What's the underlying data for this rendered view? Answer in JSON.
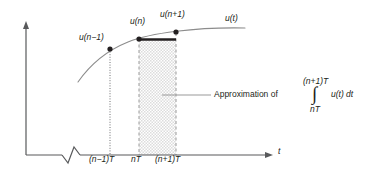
{
  "figure": {
    "type": "diagram",
    "axes": {
      "x_axis_label": "t",
      "x_axis_has_arrow": true,
      "x_axis_has_break_symbol": true,
      "y_axis_label": "",
      "y_axis_has_arrow": true,
      "tick_labels": [
        "(n−1)T",
        "nT",
        "(n+1)T"
      ]
    },
    "curve": {
      "label": "u(t)",
      "color": "#8c8c8c"
    },
    "points": [
      {
        "label": "u(n−1)",
        "tick": "(n−1)T"
      },
      {
        "label": "u(n)",
        "tick": "nT"
      },
      {
        "label": "u(n+1)",
        "tick": "(n+1)T"
      }
    ],
    "shaded_region": {
      "from_tick": "nT",
      "to_tick": "(n+1)T",
      "fill_color": "#e6e6e6",
      "border_style": "dashed",
      "top_bar_color": "#231f20"
    },
    "annotation": {
      "leader_text": "Approximation of",
      "integral_upper_limit": "(n+1)T",
      "integral_lower_limit": "nT",
      "integral_symbol": "∫",
      "integrand": "u(t) dt"
    },
    "colors": {
      "ink": "#231f20",
      "axis": "#58595b",
      "curve": "#8c8c8c",
      "shade": "#e6e6e6",
      "leader": "#8c8c8c"
    }
  }
}
